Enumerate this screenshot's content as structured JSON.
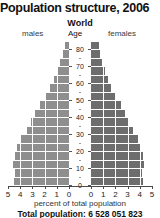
{
  "chart_data": {
    "type": "bar",
    "title": "Population structure, 2006",
    "subtitle": "World",
    "xlabel": "percent of total population",
    "ylabel": "Age",
    "left_series_label": "males",
    "right_series_label": "females",
    "footer": "Total population: 6 528 051 823",
    "grid": true,
    "legend_position": "top",
    "orientation": "horizontal-diverging",
    "xlim": [
      0,
      5
    ],
    "ylim": [
      0,
      85
    ],
    "xticks": [
      5,
      4,
      3,
      2,
      1,
      0,
      0,
      1,
      2,
      3,
      4,
      5
    ],
    "xticks_left": [
      "5",
      "4",
      "3",
      "2",
      "1",
      "0"
    ],
    "xticks_right": [
      "0",
      "1",
      "2",
      "3",
      "4",
      "5"
    ],
    "yticks": [
      "80",
      "70",
      "60",
      "50",
      "40",
      "30",
      "20",
      "10",
      "0"
    ],
    "categories": [
      "80+",
      "75-79",
      "70-74",
      "65-69",
      "60-64",
      "55-59",
      "50-54",
      "45-49",
      "40-44",
      "35-39",
      "30-34",
      "25-29",
      "20-24",
      "15-19",
      "10-14",
      "5-9",
      "0-4"
    ],
    "series": [
      {
        "name": "males",
        "color": "#8e8e8e",
        "values": [
          0.45,
          0.55,
          0.8,
          1.05,
          1.35,
          1.65,
          2.05,
          2.45,
          2.85,
          3.2,
          3.55,
          4.0,
          4.35,
          4.55,
          4.7,
          4.55,
          4.6
        ]
      },
      {
        "name": "females",
        "color": "#6d6d6d",
        "values": [
          0.75,
          0.8,
          1.0,
          1.2,
          1.5,
          1.75,
          2.1,
          2.5,
          2.85,
          3.2,
          3.55,
          3.95,
          4.2,
          4.35,
          4.45,
          4.3,
          4.35
        ]
      }
    ]
  },
  "colors": {
    "male_bar": "#8e8e8e",
    "female_bar": "#6d6d6d",
    "gridline": "#ffffff",
    "axis": "#4a4a4a",
    "background": "#ffffff"
  }
}
